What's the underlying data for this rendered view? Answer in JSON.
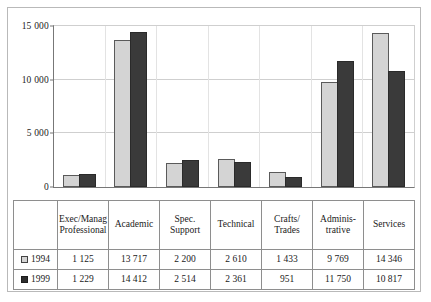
{
  "chart_data": {
    "type": "bar",
    "title": "",
    "xlabel": "",
    "ylabel": "",
    "ylim": [
      0,
      15000
    ],
    "yticks": [
      0,
      5000,
      10000,
      15000
    ],
    "ytick_labels": [
      "0",
      "5 000",
      "10 000",
      "15 000"
    ],
    "grid": true,
    "legend_position": "table-left",
    "categories": [
      "Exec/Manag Professional",
      "Academic",
      "Spec. Support",
      "Technical",
      "Crafts/ Trades",
      "Adminis- trative",
      "Services"
    ],
    "category_label_lines": [
      [
        "Exec/Manag",
        "Professional"
      ],
      [
        "Academic"
      ],
      [
        "Spec.",
        "Support"
      ],
      [
        "Technical"
      ],
      [
        "Crafts/",
        "Trades"
      ],
      [
        "Adminis-",
        "trative"
      ],
      [
        "Services"
      ]
    ],
    "series": [
      {
        "name": "1994",
        "color": "#d4d4d4",
        "values": [
          1125,
          13717,
          2200,
          2610,
          1433,
          9769,
          14346
        ],
        "value_labels": [
          "1 125",
          "13 717",
          "2 200",
          "2 610",
          "1 433",
          "9 769",
          "14 346"
        ]
      },
      {
        "name": "1999",
        "color": "#3a3a3a",
        "values": [
          1229,
          14412,
          2514,
          2361,
          951,
          11750,
          10817
        ],
        "value_labels": [
          "1 229",
          "14 412",
          "2 514",
          "2 361",
          "951",
          "11 750",
          "10 817"
        ]
      }
    ]
  },
  "legend": {
    "swatch_1994": "legend-swatch-light",
    "swatch_1999": "legend-swatch-dark"
  }
}
